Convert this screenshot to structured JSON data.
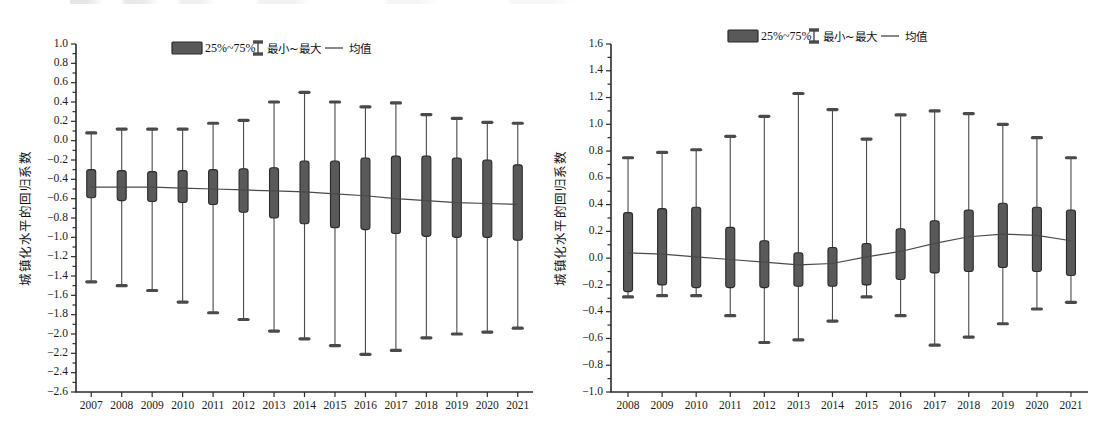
{
  "legend": {
    "box_label": "25%~75%",
    "whisker_label": "最小~最大",
    "mean_label": "均值"
  },
  "colors": {
    "box_fill": "#595959",
    "box_stroke": "#2b2b2b",
    "whisker": "#4a4a4a",
    "mean": "#4a4a4a",
    "axis": "#2b2b2b",
    "background": "#ffffff"
  },
  "chart_data": [
    {
      "type": "box",
      "id": "left-chart",
      "title": "",
      "xlabel": "",
      "ylabel": "城镇化水平的回归系数",
      "ylim": [
        -2.6,
        1.0
      ],
      "ytick_step": 0.2,
      "ytick_labels": [
        "1.0",
        "0.8",
        "0.6",
        "0.4",
        "0.2",
        "0.0",
        "-0.2",
        "-0.4",
        "-0.6",
        "-0.8",
        "-1.0",
        "-1.2",
        "-1.4",
        "-1.6",
        "-1.8",
        "-2.0",
        "-2.2",
        "-2.4",
        "-2.6"
      ],
      "grid": false,
      "legend_position": "top-center",
      "categories": [
        "2007",
        "2008",
        "2009",
        "2010",
        "2011",
        "2012",
        "2013",
        "2014",
        "2015",
        "2016",
        "2017",
        "2018",
        "2019",
        "2020",
        "2021"
      ],
      "series": [
        {
          "name": "min",
          "values": [
            -1.46,
            -1.5,
            -1.55,
            -1.67,
            -1.78,
            -1.85,
            -1.97,
            -2.05,
            -2.12,
            -2.21,
            -2.17,
            -2.04,
            -2.0,
            -1.98,
            -1.94
          ]
        },
        {
          "name": "q25",
          "values": [
            -0.59,
            -0.62,
            -0.63,
            -0.64,
            -0.66,
            -0.74,
            -0.8,
            -0.86,
            -0.9,
            -0.92,
            -0.96,
            -0.99,
            -1.0,
            -1.0,
            -1.03
          ]
        },
        {
          "name": "q75",
          "values": [
            -0.3,
            -0.31,
            -0.32,
            -0.31,
            -0.3,
            -0.29,
            -0.28,
            -0.21,
            -0.21,
            -0.18,
            -0.16,
            -0.16,
            -0.18,
            -0.2,
            -0.25
          ]
        },
        {
          "name": "max",
          "values": [
            0.08,
            0.12,
            0.12,
            0.12,
            0.18,
            0.21,
            0.4,
            0.5,
            0.4,
            0.35,
            0.39,
            0.27,
            0.23,
            0.19,
            0.18
          ]
        },
        {
          "name": "mean",
          "values": [
            -0.48,
            -0.48,
            -0.48,
            -0.49,
            -0.5,
            -0.51,
            -0.52,
            -0.53,
            -0.55,
            -0.57,
            -0.6,
            -0.62,
            -0.64,
            -0.65,
            -0.66
          ]
        }
      ]
    },
    {
      "type": "box",
      "id": "right-chart",
      "title": "",
      "xlabel": "",
      "ylabel": "城镇化水平的回归系数",
      "ylim": [
        -1.0,
        1.6
      ],
      "ytick_step": 0.2,
      "ytick_labels": [
        "1.6",
        "1.4",
        "1.2",
        "1.0",
        "0.8",
        "0.6",
        "0.4",
        "0.2",
        "0.0",
        "-0.2",
        "-0.4",
        "-0.6",
        "-0.8",
        "-1.0"
      ],
      "grid": false,
      "legend_position": "top-center",
      "categories": [
        "2008",
        "2009",
        "2010",
        "2011",
        "2012",
        "2013",
        "2014",
        "2015",
        "2016",
        "2017",
        "2018",
        "2019",
        "2020",
        "2021"
      ],
      "series": [
        {
          "name": "min",
          "values": [
            -0.29,
            -0.28,
            -0.28,
            -0.43,
            -0.63,
            -0.61,
            -0.47,
            -0.29,
            -0.43,
            -0.65,
            -0.59,
            -0.49,
            -0.38,
            -0.33
          ]
        },
        {
          "name": "q25",
          "values": [
            -0.25,
            -0.2,
            -0.22,
            -0.22,
            -0.22,
            -0.21,
            -0.21,
            -0.2,
            -0.16,
            -0.11,
            -0.1,
            -0.07,
            -0.1,
            -0.13
          ]
        },
        {
          "name": "q75",
          "values": [
            0.34,
            0.37,
            0.38,
            0.23,
            0.13,
            0.04,
            0.08,
            0.11,
            0.22,
            0.28,
            0.36,
            0.41,
            0.38,
            0.36
          ]
        },
        {
          "name": "max",
          "values": [
            0.75,
            0.79,
            0.81,
            0.91,
            1.06,
            1.23,
            1.11,
            0.89,
            1.07,
            1.1,
            1.08,
            1.0,
            0.9,
            0.75
          ]
        },
        {
          "name": "mean",
          "values": [
            0.04,
            0.03,
            0.01,
            -0.01,
            -0.03,
            -0.05,
            -0.04,
            0.01,
            0.05,
            0.11,
            0.16,
            0.18,
            0.17,
            0.13
          ]
        }
      ]
    }
  ]
}
